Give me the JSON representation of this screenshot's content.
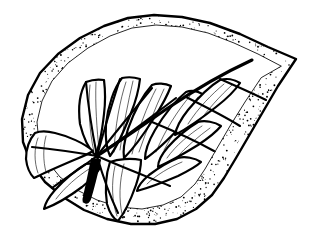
{
  "figure": {
    "kind": "botanical-line-drawing",
    "subject": "leaf",
    "title": "",
    "caption": "",
    "technique": "pen-and-ink stipple",
    "canvas": {
      "width": 313,
      "height": 238
    },
    "colors": {
      "ink": "#000000",
      "paper": "#ffffff",
      "stipple": "#000000"
    }
  },
  "geometry": {
    "hub": {
      "x": 97,
      "y": 156
    },
    "apex": {
      "x": 296,
      "y": 59
    },
    "petiole_tip": {
      "x": 85,
      "y": 202
    },
    "margin_outer": "M 296 59 L 268 47 L 240 34 L 210 23 L 182 17 L 154 15 L 128 18 L 104 26 L 80 38 L 58 54 L 40 73 L 28 95 L 22 119 L 23 142 L 31 163 L 45 182 L 63 197 L 84 210 L 107 219 L 131 224 L 155 224 L 177 219 L 196 209 L 212 195 L 224 178 L 236 158 L 250 134 L 264 110 L 278 86 L 290 68 Z",
    "margin_inner": "M 281 66 L 258 54 L 234 43 L 208 33 L 182 27 L 156 25 L 132 28 L 110 36 L 88 48 L 68 63 L 52 81 L 42 101 L 37 122 L 39 143 L 47 161 L 60 177 L 77 190 L 97 200 L 119 207 L 142 209 L 163 205 L 181 197 L 195 184 L 205 169 L 216 150 L 230 126 L 245 102 L 261 78 Z"
  },
  "veins": {
    "midrib": "M 97 156 C 120 141, 146 123, 168 108 C 196 89, 226 72, 252 60",
    "primary": [
      {
        "name": "vein-upper-left-1",
        "d": "M 97 156 C 92 131, 88 105, 86 82"
      },
      {
        "name": "vein-upper-left-2",
        "d": "M 97 156 C 104 130, 112 104, 120 79"
      },
      {
        "name": "vein-upper-mid-1",
        "d": "M 97 156 C 114 134, 134 110, 152 88"
      },
      {
        "name": "vein-upper-mid-2",
        "d": "M 97 156 C 122 139, 150 118, 176 98"
      },
      {
        "name": "vein-left-lateral",
        "d": "M 97 156 C 74 152, 52 149, 32 147"
      },
      {
        "name": "vein-lower-left",
        "d": "M 97 156 C 82 167, 66 178, 52 188"
      },
      {
        "name": "vein-lower-mid",
        "d": "M 97 156 C 103 177, 110 196, 118 213"
      },
      {
        "name": "vein-lower-right",
        "d": "M 97 156 C 122 167, 148 177, 170 186"
      },
      {
        "name": "vein-right-lateral",
        "d": "M 152 122 C 174 131, 196 141, 214 151"
      },
      {
        "name": "vein-right-upper",
        "d": "M 186 97 C 204 106, 224 116, 240 126"
      },
      {
        "name": "vein-apex-branch",
        "d": "M 220 79 C 236 86, 252 93, 266 100"
      }
    ],
    "petiole": {
      "outline": "M 92 159 C 89 174, 86 188, 84 197 C 82 203, 88 205, 90 199 C 93 189, 97 173, 100 160 Z"
    }
  },
  "areoles": [
    {
      "id": "areole-top-left-1",
      "outline": "M 86 82 C 80 92, 78 108, 80 124 C 84 140, 90 150, 95 155 C 99 148, 102 132, 104 114 C 106 98, 105 88, 104 80 C 98 79, 91 80, 86 82 Z",
      "ribs": [
        "M 90 85 C 88 104, 89 130, 94 152",
        "M 96 82 C 95 104, 97 130, 99 150"
      ]
    },
    {
      "id": "areole-top-left-2",
      "outline": "M 122 78 C 114 88, 108 106, 106 124 C 105 140, 107 150, 110 156 C 116 148, 124 131, 131 113 C 137 98, 139 88, 140 79 C 134 77, 127 77, 122 78 Z",
      "ribs": [
        "M 126 82 C 120 100, 115 126, 114 152",
        "M 133 81 C 128 102, 123 128, 120 150"
      ]
    },
    {
      "id": "areole-top-mid-1",
      "outline": "M 152 85 C 143 95, 134 112, 128 129 C 124 142, 123 152, 124 158 C 132 150, 144 134, 154 118 C 163 104, 168 94, 171 86 C 165 83, 157 83, 152 85 Z",
      "ribs": [
        "M 156 89 C 147 106, 138 130, 132 154",
        "M 164 89 C 155 108, 146 132, 139 152"
      ]
    },
    {
      "id": "areole-top-mid-2",
      "outline": "M 186 92 C 176 100, 164 115, 155 130 C 148 142, 145 152, 145 159 C 155 152, 170 138, 183 124 C 194 112, 200 103, 204 95 C 198 91, 191 90, 186 92 Z",
      "ribs": [
        "M 190 96 C 178 110, 165 130, 156 152",
        "M 198 97 C 187 112, 174 132, 164 150"
      ]
    },
    {
      "id": "areole-apex",
      "outline": "M 220 80 C 210 86, 198 98, 188 110 C 180 120, 176 129, 175 135 C 186 129, 202 118, 216 107 C 229 97, 236 89, 240 83 C 234 79, 226 78, 220 80 Z",
      "ribs": [
        "M 224 84 C 212 94, 198 108, 188 124",
        "M 232 85 C 221 95, 207 110, 196 126"
      ]
    },
    {
      "id": "areole-right-upper",
      "outline": "M 198 122 C 188 128, 176 138, 168 147 C 161 155, 158 162, 158 167 C 169 162, 185 153, 198 145 C 210 137, 217 131, 221 126 C 215 122, 205 120, 198 122 Z",
      "ribs": [
        "M 202 126 C 190 134, 176 145, 167 158",
        "M 210 128 C 199 136, 186 147, 176 158"
      ]
    },
    {
      "id": "areole-right-lower",
      "outline": "M 178 158 C 168 162, 157 169, 149 175 C 142 181, 138 186, 137 191 C 148 188, 164 182, 178 176 C 190 170, 197 166, 201 162 C 195 158, 185 156, 178 158 Z",
      "ribs": [
        "M 182 162 C 170 167, 156 175, 147 184"
      ]
    },
    {
      "id": "areole-bottom-mid",
      "outline": "M 110 162 C 106 174, 105 190, 107 204 C 110 214, 114 219, 118 221 C 124 214, 131 199, 136 185 C 140 173, 141 165, 141 160 C 131 158, 118 159, 110 162 Z",
      "ribs": [
        "M 115 166 C 111 183, 112 202, 117 216",
        "M 124 164 C 119 182, 119 200, 122 214"
      ]
    },
    {
      "id": "areole-bottom-left",
      "outline": "M 86 164 C 76 170, 64 180, 55 190 C 48 198, 45 204, 44 209 C 55 205, 70 196, 82 187 C 92 179, 97 173, 100 168 C 96 164, 91 163, 86 164 Z",
      "ribs": [
        "M 89 169 C 78 176, 65 187, 56 199"
      ]
    },
    {
      "id": "areole-left",
      "outline": "M 35 133 C 29 140, 26 150, 26 159 C 27 168, 30 174, 34 178 C 44 173, 60 166, 74 160 C 84 156, 90 153, 93 151 C 84 143, 68 136, 55 133 C 47 131, 40 131, 35 133 Z",
      "ribs": [
        "M 38 138 C 34 148, 34 162, 38 173",
        "M 46 136 C 43 147, 43 161, 46 172"
      ]
    }
  ],
  "stipple": {
    "seed": 20250613,
    "dot_count": 2600,
    "dot_radius_min": 0.35,
    "dot_radius_max": 0.95,
    "band_note": "dots densest along the outer margin band, thinning inward"
  },
  "accessibility": {
    "alt_text": "Black-and-white stippled pen-and-ink drawing of an asymmetric leaf with palmate venation and a pointed tip."
  }
}
